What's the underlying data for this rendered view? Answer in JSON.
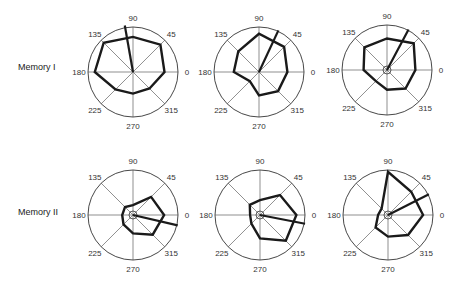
{
  "figure": {
    "rows": [
      {
        "label": "Memory I",
        "label_pos": [
          18,
          70
        ]
      },
      {
        "label": "Memory II",
        "label_pos": [
          18,
          215
        ]
      }
    ],
    "axis_labels": [
      "0",
      "45",
      "90",
      "135",
      "180",
      "225",
      "270",
      "315"
    ],
    "colors": {
      "circle": "#333333",
      "spokes": "#444444",
      "polygon": "#1a1a1a",
      "text": "#333333"
    }
  },
  "chart_data": [
    {
      "type": "polar",
      "row": "Memory I",
      "col": 1,
      "center": [
        133,
        72
      ],
      "radius": 45,
      "angles": [
        0,
        45,
        90,
        135,
        180,
        225,
        270,
        315
      ],
      "values": [
        0.7,
        0.86,
        0.78,
        0.92,
        0.85,
        0.55,
        0.48,
        0.52
      ],
      "vector": {
        "angle": 100,
        "length": 1.05
      },
      "center_circle": false
    },
    {
      "type": "polar",
      "row": "Memory I",
      "col": 2,
      "center": [
        259,
        72
      ],
      "radius": 45,
      "angles": [
        0,
        45,
        90,
        135,
        180,
        225,
        270,
        315
      ],
      "values": [
        0.63,
        0.79,
        0.85,
        0.65,
        0.56,
        0.29,
        0.52,
        0.6
      ],
      "vector": {
        "angle": 65,
        "length": 1.02
      },
      "center_circle": false
    },
    {
      "type": "polar",
      "row": "Memory I",
      "col": 3,
      "center": [
        387,
        70
      ],
      "radius": 45,
      "angles": [
        0,
        45,
        90,
        135,
        180,
        225,
        270,
        315
      ],
      "values": [
        0.63,
        0.84,
        0.7,
        0.71,
        0.52,
        0.35,
        0.44,
        0.58
      ],
      "vector": {
        "angle": 62,
        "length": 1.02
      },
      "center_circle": true
    },
    {
      "type": "polar",
      "row": "Memory II",
      "col": 1,
      "center": [
        133,
        215
      ],
      "radius": 45,
      "angles": [
        0,
        45,
        90,
        135,
        180,
        225,
        270,
        315
      ],
      "values": [
        0.69,
        0.57,
        0.22,
        0.25,
        0.24,
        0.3,
        0.41,
        0.62
      ],
      "vector": {
        "angle": 347,
        "length": 1.02
      },
      "center_circle": true
    },
    {
      "type": "polar",
      "row": "Memory II",
      "col": 2,
      "center": [
        260,
        215
      ],
      "radius": 45,
      "angles": [
        0,
        45,
        90,
        135,
        180,
        225,
        270,
        315
      ],
      "values": [
        0.81,
        0.63,
        0.33,
        0.32,
        0.22,
        0.27,
        0.52,
        0.81
      ],
      "vector": {
        "angle": 349,
        "length": 1.02
      },
      "center_circle": true
    },
    {
      "type": "polar",
      "row": "Memory II",
      "col": 3,
      "center": [
        388,
        215
      ],
      "radius": 45,
      "angles": [
        0,
        45,
        90,
        135,
        180,
        225,
        270,
        315
      ],
      "values": [
        0.78,
        0.73,
        0.96,
        0.2,
        0.22,
        0.39,
        0.48,
        0.63
      ],
      "vector": {
        "angle": 27,
        "length": 1.02
      },
      "center_circle": true
    }
  ]
}
